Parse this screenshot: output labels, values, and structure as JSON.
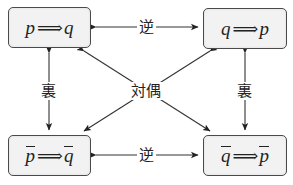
{
  "diagram": {
    "type": "logic-square",
    "boxes": {
      "top_left": {
        "left": "p",
        "left_negated": false,
        "symbol": "⟹",
        "right": "q",
        "right_negated": false
      },
      "top_right": {
        "left": "q",
        "left_negated": false,
        "symbol": "⟹",
        "right": "p",
        "right_negated": false
      },
      "bottom_left": {
        "left": "p",
        "left_negated": true,
        "symbol": "⟹",
        "right": "q",
        "right_negated": true
      },
      "bottom_right": {
        "left": "q",
        "left_negated": true,
        "symbol": "⟹",
        "right": "p",
        "right_negated": true
      }
    },
    "labels": {
      "top_relation": "逆",
      "bottom_relation": "逆",
      "left_relation": "裏",
      "right_relation": "裏",
      "center_relation": "対偶"
    },
    "edges": [
      {
        "from": "top_left",
        "to": "top_right",
        "label": "逆",
        "bidirectional": true
      },
      {
        "from": "bottom_left",
        "to": "bottom_right",
        "label": "逆",
        "bidirectional": true
      },
      {
        "from": "top_left",
        "to": "bottom_left",
        "label": "裏",
        "bidirectional": true
      },
      {
        "from": "top_right",
        "to": "bottom_right",
        "label": "裏",
        "bidirectional": true
      },
      {
        "from": "top_left",
        "to": "bottom_right",
        "label": "対偶",
        "bidirectional": true
      },
      {
        "from": "top_right",
        "to": "bottom_left",
        "label": "対偶",
        "bidirectional": true
      }
    ],
    "colors": {
      "line": "#333333",
      "box_fill": "#f2f2f2",
      "box_border": "#4a4a4a"
    }
  }
}
